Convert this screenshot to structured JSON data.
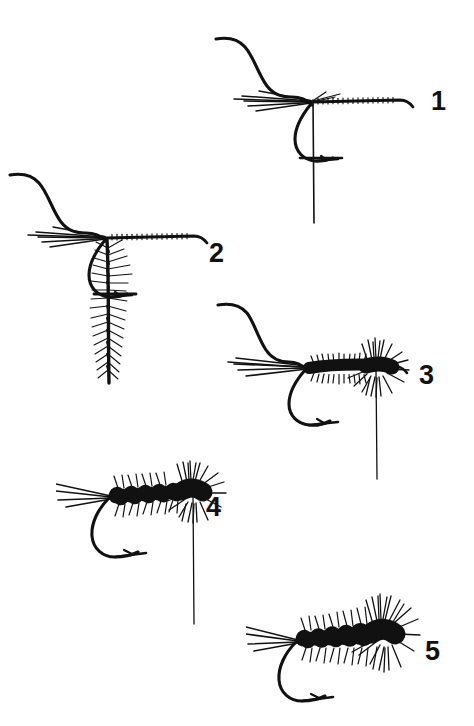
{
  "illustration": {
    "title": "Fly Tying Step Sequence",
    "subject": "woolly-worm-fly-tying-diagram",
    "background_color": "#ffffff",
    "ink_color": "#111111",
    "style": "black-and-white line art",
    "step_count": 5
  },
  "steps": [
    {
      "number": "1",
      "label": "Step 1",
      "description": "Hook in vise with thread base wrapped along shank, tail fibers tied in at the bend, bobbin thread hanging down",
      "number_x": 431,
      "number_y": 88,
      "figure_x": 214,
      "figure_y": 34,
      "parts": [
        "hook",
        "thread-wraps",
        "tail-fibers",
        "hanging-thread",
        "bobbin-crossbar"
      ]
    },
    {
      "number": "2",
      "label": "Step 2",
      "description": "Hackle feather tied in by the tip at the bend and hanging vertically, ready to be palmered forward",
      "number_x": 209,
      "number_y": 240,
      "figure_x": 8,
      "figure_y": 170,
      "parts": [
        "hook",
        "thread-wraps",
        "tail-fibers",
        "hackle-feather",
        "hanging-thread",
        "bobbin-crossbar"
      ]
    },
    {
      "number": "3",
      "label": "Step 3",
      "description": "Dubbed chenille body wound forward along the shank with bushy fibers at the head",
      "number_x": 419,
      "number_y": 362,
      "figure_x": 216,
      "figure_y": 300,
      "parts": [
        "hook",
        "tail-fibers",
        "chenille-body",
        "head-fibers",
        "hanging-thread"
      ]
    },
    {
      "number": "4",
      "label": "Step 4",
      "description": "Hackle palmered forward over the body in evenly spaced segments, tied off at the head",
      "number_x": 206,
      "number_y": 494,
      "figure_x": 56,
      "figure_y": 460,
      "parts": [
        "hook",
        "tail-fibers",
        "palmered-body",
        "head-hackle",
        "hanging-thread"
      ]
    },
    {
      "number": "5",
      "label": "Step 5",
      "description": "Finished fly with full palmered hackle, dense collar hackle at the head and whip-finished thread",
      "number_x": 425,
      "number_y": 638,
      "figure_x": 246,
      "figure_y": 592,
      "parts": [
        "hook",
        "tail-fibers",
        "palmered-body",
        "collar-hackle"
      ]
    }
  ]
}
